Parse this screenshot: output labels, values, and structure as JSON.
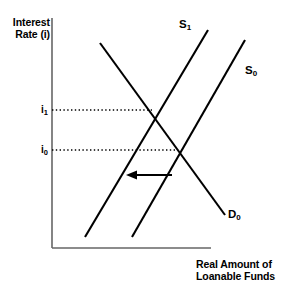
{
  "figure": {
    "kind": "economics-supply-demand-diagram",
    "background_color": "#ffffff",
    "line_color": "#000000",
    "axis_color": "#555555"
  },
  "axes": {
    "y_title_line1": "Interest",
    "y_title_line2": "Rate (i)",
    "x_title_line1": "Real Amount of",
    "x_title_line2": "Loanable Funds",
    "origin_x": 52,
    "origin_y": 248,
    "y_top": 18,
    "x_right": 210
  },
  "ticks": [
    {
      "label": "i",
      "subscript": "1",
      "y": 110,
      "dotted_to_x": 152
    },
    {
      "label": "i",
      "subscript": "0",
      "y": 150,
      "dotted_to_x": 178
    }
  ],
  "curves": [
    {
      "name": "supply-shifted",
      "label": "S",
      "subscript": "1",
      "x1": 85,
      "y1": 237,
      "x2": 208,
      "y2": 30,
      "label_x": 179,
      "label_y": 18
    },
    {
      "name": "supply-original",
      "label": "S",
      "subscript": "0",
      "x1": 132,
      "y1": 237,
      "x2": 245,
      "y2": 40,
      "label_x": 245,
      "label_y": 64
    },
    {
      "name": "demand",
      "label": "D",
      "subscript": "0",
      "x1": 100,
      "y1": 43,
      "x2": 225,
      "y2": 215,
      "label_x": 228,
      "label_y": 208
    }
  ],
  "annotations": {
    "shift_arrow": {
      "name": "leftward-shift-arrow",
      "direction": "left",
      "from_x": 172,
      "to_x": 128,
      "y": 175
    }
  },
  "chart_data": {
    "type": "line",
    "title": "",
    "xlabel": "Real Amount of Loanable Funds",
    "ylabel": "Interest Rate (i)",
    "grid": false,
    "legend": "inline-curve-labels",
    "x_tick_labels": [],
    "y_tick_labels": [
      "i₀",
      "i₁"
    ],
    "series": [
      {
        "name": "S₁",
        "role": "supply-after-shift",
        "slope": "upward",
        "points": [
          [
            85,
            237
          ],
          [
            208,
            30
          ]
        ]
      },
      {
        "name": "S₀",
        "role": "supply-before-shift",
        "slope": "upward",
        "points": [
          [
            132,
            237
          ],
          [
            245,
            40
          ]
        ]
      },
      {
        "name": "D₀",
        "role": "demand",
        "slope": "downward",
        "points": [
          [
            100,
            43
          ],
          [
            225,
            215
          ]
        ]
      }
    ],
    "equilibria": [
      {
        "name": "initial",
        "interest_rate": "i₀",
        "intersection": "D₀ × S₀",
        "x": 178,
        "y": 150
      },
      {
        "name": "new",
        "interest_rate": "i₁",
        "intersection": "D₀ × S₁",
        "x": 152,
        "y": 110
      }
    ],
    "annotation": "Supply of loanable funds shifts left from S₀ to S₁, raising the interest rate from i₀ to i₁."
  }
}
